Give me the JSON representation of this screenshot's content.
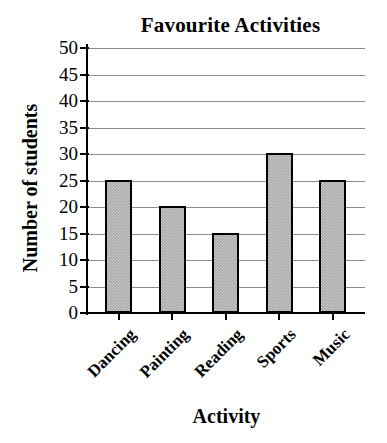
{
  "chart_data": {
    "type": "bar",
    "title": "Favourite Activities",
    "xlabel": "Activity",
    "ylabel": "Number of students",
    "categories": [
      "Dancing",
      "Painting",
      "Reading",
      "Sports",
      "Music"
    ],
    "values": [
      25,
      20,
      15,
      30,
      25
    ],
    "ylim": [
      0,
      50
    ],
    "ytick_step": 5,
    "yticks": [
      50,
      45,
      40,
      35,
      30,
      25,
      20,
      15,
      10,
      5,
      0
    ],
    "ytick_labels": [
      "50",
      "45",
      "40",
      "35",
      "30",
      "25",
      "20",
      "15",
      "10",
      "5",
      "0"
    ],
    "grid": true,
    "grid_axis": "y",
    "legend": null,
    "bar_fill_color": "#a9a9a9",
    "bar_edge_color": "#000000",
    "gridline_color": "#8c8c8c",
    "axis_color": "#000000",
    "background_color": "#ffffff",
    "xtick_label_rotation": 45
  }
}
